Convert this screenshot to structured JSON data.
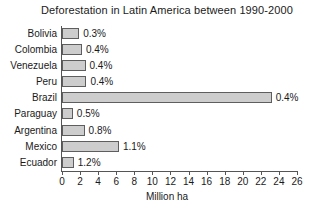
{
  "chart_data": {
    "type": "bar",
    "orientation": "horizontal",
    "title": "Deforestation in Latin America between 1990-2000",
    "xlabel": "Million ha",
    "ylabel": "",
    "categories": [
      "Bolivia",
      "Colombia",
      "Venezuela",
      "Peru",
      "Brazil",
      "Paraguay",
      "Argentina",
      "Mexico",
      "Ecuador"
    ],
    "values": [
      1.9,
      2.2,
      2.6,
      2.7,
      23.2,
      1.2,
      2.5,
      6.3,
      1.3
    ],
    "data_labels": [
      "0.3%",
      "0.4%",
      "0.4%",
      "0.4%",
      "0.4%",
      "0.5%",
      "0.8%",
      "1.1%",
      "1.2%"
    ],
    "xlim": [
      0,
      26
    ],
    "xticks": [
      0,
      2,
      4,
      6,
      8,
      10,
      12,
      14,
      16,
      18,
      20,
      22,
      24,
      26
    ],
    "xtick_labels": [
      "0",
      "2",
      "4",
      "6",
      "8",
      "10",
      "12",
      "14",
      "16",
      "18",
      "20",
      "22",
      "24",
      "26"
    ],
    "grid": false,
    "legend": false,
    "bar_fill_color": "#cdcdcd",
    "bar_border_color": "#5e5e5e",
    "axis_color": "#555555",
    "text_color": "#1a1a1a",
    "background_color": "#ffffff"
  }
}
